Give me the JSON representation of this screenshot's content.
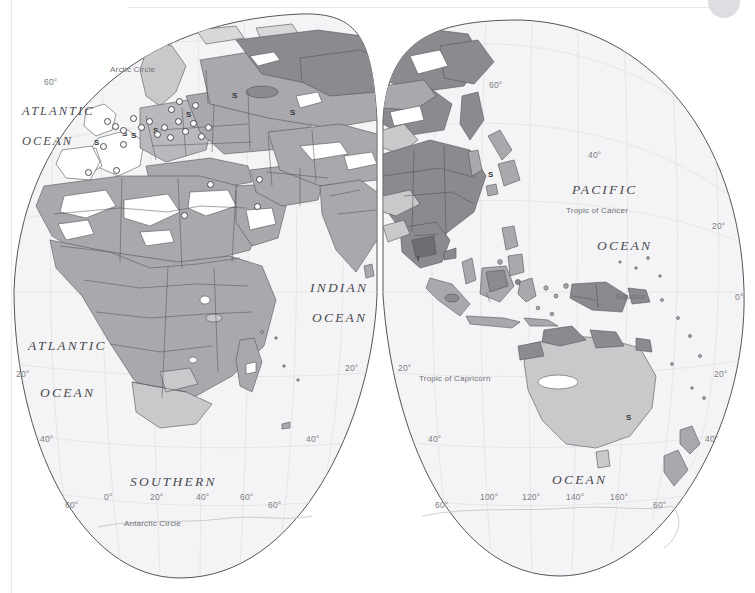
{
  "page": {
    "background_color": "#ffffff",
    "width": 755,
    "height": 593
  },
  "legend_colors": {
    "ocean_fill": "#f4f4f6",
    "land_light": "#c9c9cb",
    "land_medium": "#a9a9ad",
    "land_dark": "#8a8a8f",
    "land_white": "#ffffff",
    "outline": "#55555a",
    "border_line": "#6a6a70",
    "graticule": "#dcdce0",
    "text_gray": "#4a4a4f"
  },
  "ocean_labels": [
    {
      "text": "ATLANTIC",
      "x": 22,
      "y": 104,
      "size": "sm"
    },
    {
      "text": "OCEAN",
      "x": 22,
      "y": 134,
      "size": "sm"
    },
    {
      "text": "ATLANTIC",
      "x": 28,
      "y": 338,
      "size": "lg"
    },
    {
      "text": "OCEAN",
      "x": 40,
      "y": 385,
      "size": "lg"
    },
    {
      "text": "INDIAN",
      "x": 310,
      "y": 280,
      "size": "lg"
    },
    {
      "text": "OCEAN",
      "x": 312,
      "y": 310,
      "size": "lg"
    },
    {
      "text": "PACIFIC",
      "x": 572,
      "y": 182,
      "size": "lg"
    },
    {
      "text": "OCEAN",
      "x": 597,
      "y": 238,
      "size": "lg"
    },
    {
      "text": "SOUTHERN",
      "x": 130,
      "y": 474,
      "size": "lg"
    },
    {
      "text": "OCEAN",
      "x": 552,
      "y": 472,
      "size": "lg"
    }
  ],
  "circle_labels": [
    {
      "text": "Arctic Circle",
      "x": 110,
      "y": 65
    },
    {
      "text": "Tropic of Cancer",
      "x": 566,
      "y": 206
    },
    {
      "text": "Equator",
      "x": 616,
      "y": 292
    },
    {
      "text": "Tropic of Capricorn",
      "x": 419,
      "y": 374
    },
    {
      "text": "Antarctic Circle",
      "x": 124,
      "y": 519
    }
  ],
  "graticule_labels": [
    {
      "text": "60°",
      "x": 44,
      "y": 77
    },
    {
      "text": "40°",
      "x": 588,
      "y": 150
    },
    {
      "text": "60°",
      "x": 489,
      "y": 80
    },
    {
      "text": "20°",
      "x": 712,
      "y": 221
    },
    {
      "text": "0°",
      "x": 735,
      "y": 292
    },
    {
      "text": "20°",
      "x": 16,
      "y": 369
    },
    {
      "text": "20°",
      "x": 345,
      "y": 363
    },
    {
      "text": "20°",
      "x": 398,
      "y": 363
    },
    {
      "text": "20°",
      "x": 714,
      "y": 369
    },
    {
      "text": "40°",
      "x": 40,
      "y": 434
    },
    {
      "text": "40°",
      "x": 306,
      "y": 434
    },
    {
      "text": "40°",
      "x": 428,
      "y": 434
    },
    {
      "text": "40°",
      "x": 705,
      "y": 434
    },
    {
      "text": "60°",
      "x": 65,
      "y": 500
    },
    {
      "text": "0°",
      "x": 104,
      "y": 492
    },
    {
      "text": "20°",
      "x": 150,
      "y": 492
    },
    {
      "text": "40°",
      "x": 196,
      "y": 492
    },
    {
      "text": "60°",
      "x": 240,
      "y": 492
    },
    {
      "text": "60°",
      "x": 268,
      "y": 500
    },
    {
      "text": "60°",
      "x": 435,
      "y": 500
    },
    {
      "text": "100°",
      "x": 480,
      "y": 492
    },
    {
      "text": "120°",
      "x": 522,
      "y": 492
    },
    {
      "text": "140°",
      "x": 566,
      "y": 492
    },
    {
      "text": "160°",
      "x": 610,
      "y": 492
    },
    {
      "text": "60°",
      "x": 653,
      "y": 500
    }
  ],
  "map_markers": [
    {
      "label": "S",
      "x": 122,
      "y": 129
    },
    {
      "label": "S",
      "x": 131,
      "y": 131
    },
    {
      "label": "S",
      "x": 94,
      "y": 138
    },
    {
      "label": "S",
      "x": 153,
      "y": 126
    },
    {
      "label": "S",
      "x": 232,
      "y": 91
    },
    {
      "label": "S",
      "x": 186,
      "y": 110
    },
    {
      "label": "S",
      "x": 290,
      "y": 108
    },
    {
      "label": "S",
      "x": 488,
      "y": 170
    },
    {
      "label": "S",
      "x": 626,
      "y": 413
    },
    {
      "label": "I",
      "x": 417,
      "y": 254
    }
  ],
  "star_markers": [
    {
      "x": 104,
      "y": 118
    },
    {
      "x": 112,
      "y": 123
    },
    {
      "x": 120,
      "y": 127
    },
    {
      "x": 130,
      "y": 115
    },
    {
      "x": 138,
      "y": 124
    },
    {
      "x": 146,
      "y": 118
    },
    {
      "x": 154,
      "y": 131
    },
    {
      "x": 161,
      "y": 124
    },
    {
      "x": 167,
      "y": 134
    },
    {
      "x": 175,
      "y": 118
    },
    {
      "x": 182,
      "y": 128
    },
    {
      "x": 190,
      "y": 120
    },
    {
      "x": 198,
      "y": 133
    },
    {
      "x": 205,
      "y": 124
    },
    {
      "x": 120,
      "y": 141
    },
    {
      "x": 100,
      "y": 143
    },
    {
      "x": 168,
      "y": 106
    },
    {
      "x": 176,
      "y": 98
    },
    {
      "x": 192,
      "y": 102
    },
    {
      "x": 85,
      "y": 169
    },
    {
      "x": 113,
      "y": 167
    },
    {
      "x": 207,
      "y": 181
    },
    {
      "x": 256,
      "y": 176
    },
    {
      "x": 254,
      "y": 203
    },
    {
      "x": 181,
      "y": 212
    }
  ],
  "lobes": {
    "left": {
      "name": "africa-europe-lobe",
      "center_lon": 20,
      "top_y": 14,
      "bottom_y": 579
    },
    "right": {
      "name": "asia-australia-lobe",
      "center_lon": 120,
      "top_y": 20,
      "bottom_y": 576
    }
  },
  "scan_artifacts": {
    "top_rule": true,
    "left_rule": true,
    "corner_dot": true
  }
}
